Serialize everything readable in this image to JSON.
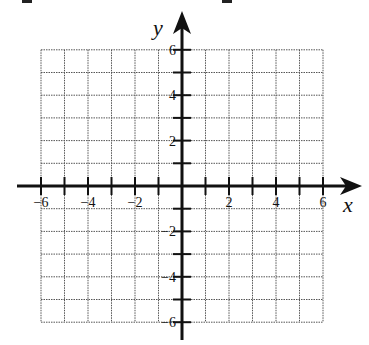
{
  "header": {
    "cutoff_glyphs": [
      "2",
      "2"
    ]
  },
  "graph": {
    "type": "coordinate-grid",
    "x_axis": {
      "label": "x",
      "min": -6,
      "max": 6,
      "step": 1,
      "tick_labels": [
        "-6",
        "-4",
        "-2",
        "2",
        "4",
        "6"
      ]
    },
    "y_axis": {
      "label": "y",
      "min": -6,
      "max": 6,
      "step": 1,
      "tick_labels": [
        "6",
        "4",
        "2",
        "-2",
        "-4",
        "-6"
      ]
    },
    "grid": true,
    "colors": {
      "axis": "#111111",
      "grid": "#555555",
      "background": "#ffffff"
    }
  }
}
